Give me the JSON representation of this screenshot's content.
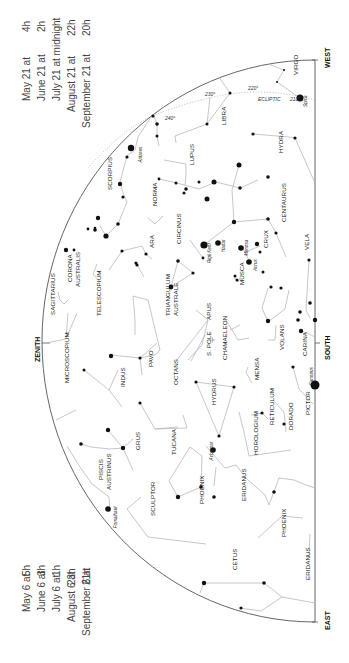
{
  "cardinals": {
    "west": "WEST",
    "south": "SOUTH",
    "east": "EAST",
    "zenith": "ZENITH"
  },
  "times_top": [
    {
      "date": "May 21 at",
      "time": "4h"
    },
    {
      "date": "June 21 at",
      "time": "2h"
    },
    {
      "date": "July 21 at midnight",
      "time": ""
    },
    {
      "date": "August 21 at",
      "time": "22h"
    },
    {
      "date": "September 21 at",
      "time": "20h"
    }
  ],
  "times_bottom": [
    {
      "date": "May 6 at",
      "time": "5h"
    },
    {
      "date": "June 6 at",
      "time": "3h"
    },
    {
      "date": "July 6 at",
      "time": "1h"
    },
    {
      "date": "August 6 at",
      "time": "23h"
    },
    {
      "date": "September 6 at",
      "time": "21h"
    }
  ],
  "ecliptic": {
    "label": "ECLIPTIC",
    "marks": [
      "210°",
      "220°",
      "230°",
      "240°"
    ]
  },
  "constellations": [
    {
      "name": "VIRGO",
      "x": 298,
      "y": 75
    },
    {
      "name": "LIBRA",
      "x": 226,
      "y": 125
    },
    {
      "name": "HYDRA",
      "x": 283,
      "y": 153
    },
    {
      "name": "LUPUS",
      "x": 194,
      "y": 165
    },
    {
      "name": "SCORPIUS",
      "x": 112,
      "y": 190
    },
    {
      "name": "NORMA",
      "x": 157,
      "y": 206
    },
    {
      "name": "CENTAURUS",
      "x": 286,
      "y": 222
    },
    {
      "name": "ARA",
      "x": 154,
      "y": 248
    },
    {
      "name": "CIRCINUS",
      "x": 181,
      "y": 244
    },
    {
      "name": "CRUX",
      "x": 268,
      "y": 248
    },
    {
      "name": "VELA",
      "x": 309,
      "y": 250
    },
    {
      "name": "CORONA",
      "x": 72,
      "y": 282
    },
    {
      "name": "AUSTRALIS",
      "x": 80,
      "y": 287
    },
    {
      "name": "MUSCA",
      "x": 244,
      "y": 285
    },
    {
      "name": "TRIANGULUM",
      "x": 170,
      "y": 316
    },
    {
      "name": "AUSTRALE",
      "x": 178,
      "y": 316
    },
    {
      "name": "TELESCOPIUM",
      "x": 101,
      "y": 316
    },
    {
      "name": "SAGITTARIUS",
      "x": 55,
      "y": 315
    },
    {
      "name": "APUS",
      "x": 211,
      "y": 320
    },
    {
      "name": "CHAMAELEON",
      "x": 227,
      "y": 360
    },
    {
      "name": "CARINA",
      "x": 307,
      "y": 356
    },
    {
      "name": "VOLANS",
      "x": 284,
      "y": 350
    },
    {
      "name": "S. POLE",
      "x": 211,
      "y": 356
    },
    {
      "name": "PAVO",
      "x": 153,
      "y": 367
    },
    {
      "name": "OCTANS",
      "x": 178,
      "y": 385
    },
    {
      "name": "MENSA",
      "x": 259,
      "y": 380
    },
    {
      "name": "MICROSCOPIUM",
      "x": 69,
      "y": 383
    },
    {
      "name": "INDUS",
      "x": 125,
      "y": 387
    },
    {
      "name": "HYDRUS",
      "x": 216,
      "y": 405
    },
    {
      "name": "RETICULUM",
      "x": 274,
      "y": 425
    },
    {
      "name": "DORADO",
      "x": 293,
      "y": 430
    },
    {
      "name": "PICTOR",
      "x": 310,
      "y": 415
    },
    {
      "name": "HOROLOGIUM",
      "x": 258,
      "y": 455
    },
    {
      "name": "GRUS",
      "x": 140,
      "y": 450
    },
    {
      "name": "TUCANA",
      "x": 176,
      "y": 455
    },
    {
      "name": "PISCIS",
      "x": 103,
      "y": 480
    },
    {
      "name": "AUSTRINUS",
      "x": 111,
      "y": 490
    },
    {
      "name": "PHOENIX",
      "x": 204,
      "y": 504
    },
    {
      "name": "ERIDANUS",
      "x": 246,
      "y": 501
    },
    {
      "name": "SCULPTOR",
      "x": 155,
      "y": 516
    },
    {
      "name": "PHOENIX",
      "x": 286,
      "y": 537
    },
    {
      "name": "CETUS",
      "x": 237,
      "y": 570
    },
    {
      "name": "ERIDANUS",
      "x": 310,
      "y": 580
    }
  ],
  "stars": [
    {
      "name": "Spica",
      "x": 300,
      "y": 98
    },
    {
      "name": "Antares",
      "x": 135,
      "y": 150
    },
    {
      "name": "Rigil Kent",
      "x": 204,
      "y": 245
    },
    {
      "name": "Hadar",
      "x": 218,
      "y": 243
    },
    {
      "name": "Mimosa",
      "x": 241,
      "y": 245
    },
    {
      "name": "Acrux",
      "x": 250,
      "y": 262
    },
    {
      "name": "Canopus",
      "x": 306,
      "y": 373
    },
    {
      "name": "Achernar",
      "x": 206,
      "y": 446
    },
    {
      "name": "Fomalhaut",
      "x": 110,
      "y": 512
    }
  ]
}
